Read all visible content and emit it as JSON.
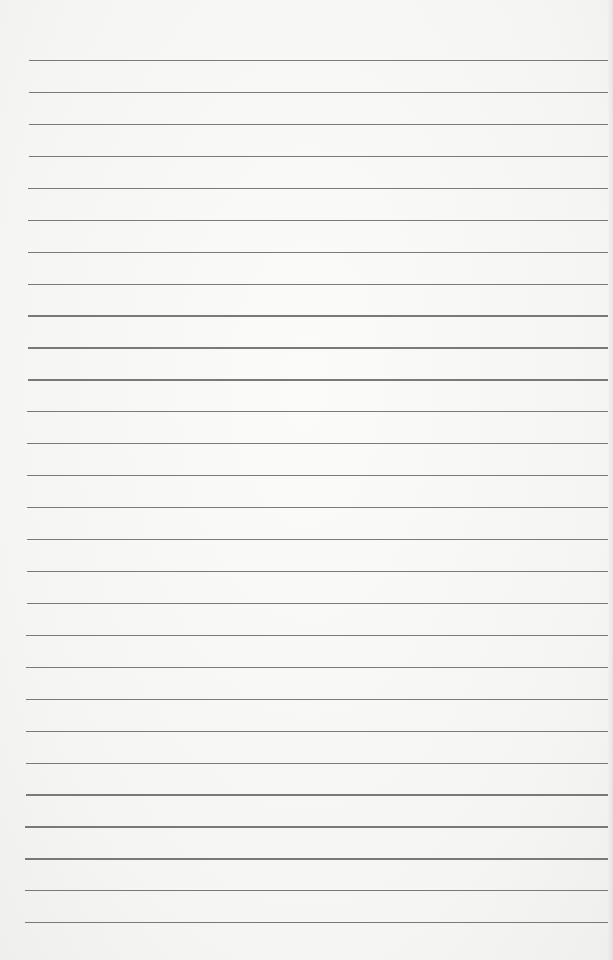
{
  "page": {
    "type": "lined-paper",
    "background_color": "#f6f6f4",
    "line_color": "#6b6b6b",
    "line_count": 28,
    "first_line_y": 60,
    "line_spacing": 31.93,
    "line_left_start": 29,
    "line_left_end": 25,
    "line_right": 608
  }
}
